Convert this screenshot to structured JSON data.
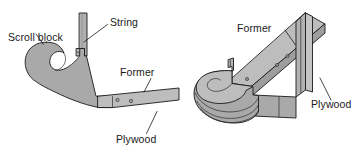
{
  "figure": {
    "background_color": "#ffffff",
    "line_color": "#1a1a1a",
    "views": [
      {
        "name": "side-elevation",
        "position": "left",
        "description": "Side elevation of scroll block with string, former and plywood"
      },
      {
        "name": "isometric",
        "position": "right",
        "description": "Isometric view of laminated scroll block, former and plywood"
      }
    ]
  },
  "colors": {
    "wood_fill": "#a9a9a9",
    "wood_fill_light": "#bdbdbd",
    "wood_fill_dark": "#949494",
    "wood_fill_darker": "#8a8a8a",
    "plywood_face": "#c4c4c4",
    "plywood_edge": "#9e9e9e",
    "string_fill": "#b0b0b0",
    "outline": "#1a1a1a",
    "text": "#1a1a1a"
  },
  "left_view": {
    "labels": {
      "scroll_block": "Scroll block",
      "string": "String",
      "former": "Former",
      "plywood": "Plywood"
    },
    "parts": {
      "scroll_block_name": "scroll-block",
      "string_name": "string",
      "former_name": "former",
      "plywood_name": "plywood",
      "bracket_name": "string-bracket"
    },
    "screw_count": 2
  },
  "right_view": {
    "labels": {
      "former": "Former",
      "plywood": "Plywood"
    },
    "parts": {
      "laminated_block_name": "laminated-scroll-block",
      "former_name": "former-arm",
      "plywood_name": "plywood-panel",
      "tab_name": "locating-tab"
    },
    "lamination_layers": 3,
    "screw_count": 3
  }
}
